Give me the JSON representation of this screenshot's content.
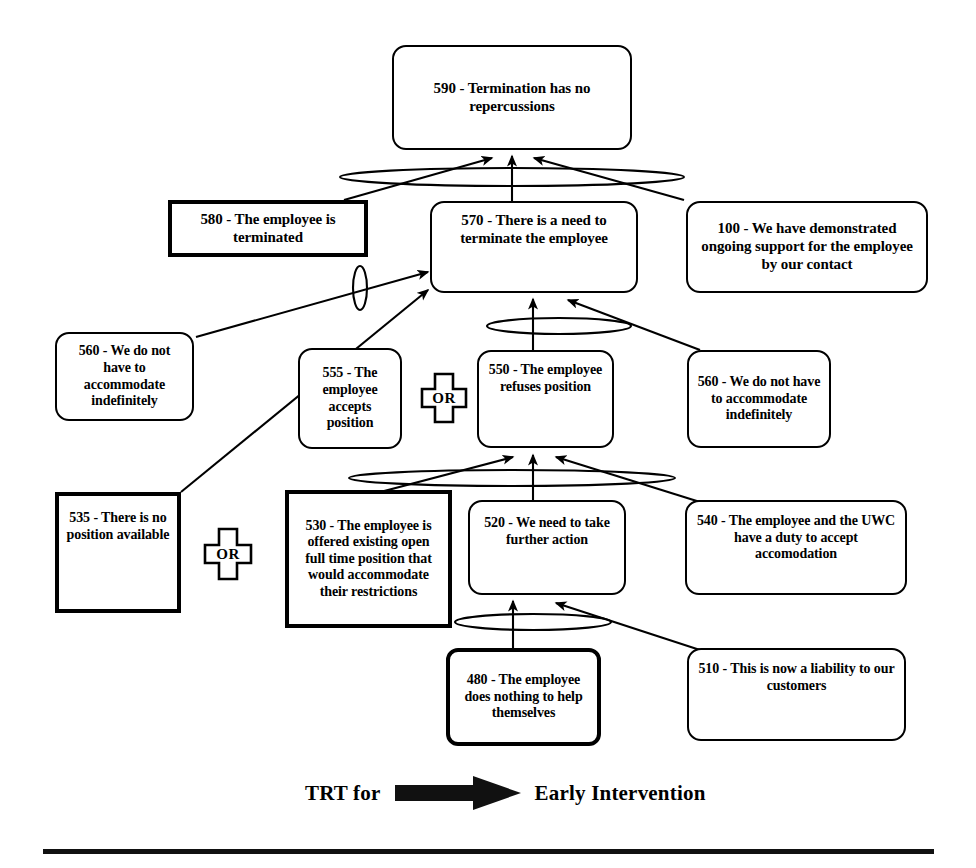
{
  "diagram": {
    "title_caption": {
      "left_text": "TRT for",
      "arrow_icon": "right-arrow-icon",
      "right_text": "Early Intervention"
    },
    "nodes": [
      {
        "id": "n590",
        "code": "590",
        "text": "590 - Termination has no repercussions",
        "shape": "rounded",
        "x": 392,
        "y": 45,
        "w": 240,
        "h": 105,
        "font_size": 15
      },
      {
        "id": "n580",
        "code": "580",
        "text": "580 - The employee is terminated",
        "shape": "thick-rect",
        "x": 168,
        "y": 200,
        "w": 200,
        "h": 57,
        "font_size": 15
      },
      {
        "id": "n570",
        "code": "570",
        "text": "570 - There is a need to terminate the employee",
        "shape": "rounded",
        "x": 430,
        "y": 201,
        "w": 208,
        "h": 92,
        "font_size": 15
      },
      {
        "id": "n100",
        "code": "100",
        "text": "100 - We have demonstrated ongoing support for the employee by our contact",
        "shape": "rounded",
        "x": 686,
        "y": 201,
        "w": 242,
        "h": 92,
        "font_size": 15
      },
      {
        "id": "n560a",
        "code": "560",
        "text": "560 - We do not have to accommodate indefinitely",
        "shape": "rounded",
        "x": 55,
        "y": 332,
        "w": 139,
        "h": 89,
        "font_size": 14
      },
      {
        "id": "n555",
        "code": "555",
        "text": "555 - The employee accepts position",
        "shape": "rounded",
        "x": 298,
        "y": 348,
        "w": 104,
        "h": 101,
        "font_size": 14
      },
      {
        "id": "n550",
        "code": "550",
        "text": "550 - The employee refuses position",
        "shape": "rounded",
        "x": 477,
        "y": 350,
        "w": 137,
        "h": 98,
        "font_size": 14
      },
      {
        "id": "n560b",
        "code": "560",
        "text": "560 - We do not have to accommodate indefinitely",
        "shape": "rounded",
        "x": 687,
        "y": 350,
        "w": 144,
        "h": 98,
        "font_size": 14
      },
      {
        "id": "n535",
        "code": "535",
        "text": "535 - There is no position available",
        "shape": "thick-rect",
        "x": 55,
        "y": 492,
        "w": 126,
        "h": 121,
        "font_size": 14
      },
      {
        "id": "n530",
        "code": "530",
        "text": "530 - The employee is offered existing open full time position that would accommodate their restrictions",
        "shape": "thick-rect",
        "x": 285,
        "y": 490,
        "w": 167,
        "h": 138,
        "font_size": 14
      },
      {
        "id": "n520",
        "code": "520",
        "text": "520 - We need to take further action",
        "shape": "rounded",
        "x": 468,
        "y": 500,
        "w": 158,
        "h": 95,
        "font_size": 14
      },
      {
        "id": "n540",
        "code": "540",
        "text": "540 - The employee and the UWC have a duty to accept accomodation",
        "shape": "rounded",
        "x": 685,
        "y": 500,
        "w": 222,
        "h": 95,
        "font_size": 14
      },
      {
        "id": "n480",
        "code": "480",
        "text": "480 - The employee does nothing to help themselves",
        "shape": "thick-rect-round",
        "x": 446,
        "y": 648,
        "w": 155,
        "h": 98,
        "font_size": 14
      },
      {
        "id": "n510",
        "code": "510",
        "text": "510 - This is now a liability to our customers",
        "shape": "rounded",
        "x": 687,
        "y": 648,
        "w": 219,
        "h": 93,
        "font_size": 14
      }
    ],
    "or_gates": [
      {
        "id": "or1",
        "label": "OR",
        "x": 420,
        "y": 372,
        "w": 48,
        "h": 52
      },
      {
        "id": "or2",
        "label": "OR",
        "x": 203,
        "y": 527,
        "w": 50,
        "h": 54
      }
    ],
    "and_connectors": [
      {
        "id": "and-590",
        "type": "ellipse-horizontal",
        "cx": 512,
        "cy": 177,
        "rx": 172,
        "ry": 9
      },
      {
        "id": "and-570-left",
        "type": "ellipse-vertical",
        "cx": 360,
        "cy": 288,
        "rx": 7,
        "ry": 21
      },
      {
        "id": "and-550",
        "type": "ellipse-horizontal",
        "cx": 559,
        "cy": 325,
        "rx": 72,
        "ry": 8
      },
      {
        "id": "and-530",
        "type": "ellipse-horizontal",
        "cx": 512,
        "cy": 478,
        "rx": 163,
        "ry": 8
      },
      {
        "id": "and-520",
        "type": "ellipse-horizontal",
        "cx": 533,
        "cy": 622,
        "rx": 78,
        "ry": 8
      }
    ],
    "arrows": [
      {
        "id": "a-580-to-590",
        "from": "n580",
        "to": "n590",
        "label": ""
      },
      {
        "id": "a-570-to-590",
        "from": "n570",
        "to": "n590",
        "label": ""
      },
      {
        "id": "a-100-to-590",
        "from": "n100",
        "to": "n590",
        "label": ""
      },
      {
        "id": "a-560a-to-570",
        "from": "n560a",
        "to": "n570",
        "label": ""
      },
      {
        "id": "a-535-to-570",
        "from": "n535",
        "to": "n570",
        "label": ""
      },
      {
        "id": "a-550-to-570",
        "from": "n550",
        "to": "n570",
        "label": ""
      },
      {
        "id": "a-560b-to-570",
        "from": "n560b",
        "to": "n570",
        "label": ""
      },
      {
        "id": "a-530-to-550",
        "from": "n530",
        "to": "n550",
        "label": ""
      },
      {
        "id": "a-520-to-550",
        "from": "n520",
        "to": "n550",
        "label": ""
      },
      {
        "id": "a-540-to-550",
        "from": "n540",
        "to": "n550",
        "label": ""
      },
      {
        "id": "a-480-to-520",
        "from": "n480",
        "to": "n520",
        "label": ""
      },
      {
        "id": "a-510-to-520",
        "from": "n510",
        "to": "n520",
        "label": ""
      }
    ],
    "footer_rule": {
      "x": 43,
      "y": 849,
      "w": 891,
      "h": 5
    },
    "colors": {
      "ink": "#000000",
      "background": "#ffffff",
      "rule": "#111111"
    }
  }
}
